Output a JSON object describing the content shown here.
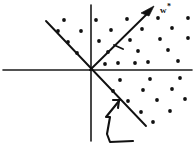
{
  "figure": {
    "background_color": "#ffffff",
    "ink_color": "#111111",
    "width": 196,
    "height": 148,
    "labels": {
      "weight_vector": "w",
      "weight_vector_superscript": "*",
      "weight_vector_full": "w*"
    }
  },
  "chart_data": {
    "type": "scatter",
    "subtitle": "",
    "xlabel": "",
    "ylabel": "",
    "grid": false,
    "legend_position": "none",
    "annotations": [
      {
        "name": "weight-vector-label",
        "text": "w*",
        "x": 161,
        "y": 10,
        "description": "Bold label marking the optimal weight vector arrow"
      },
      {
        "name": "hand-pointer-annotation",
        "text": "",
        "x": 118,
        "y": 120,
        "description": "Hand-drawn hook arrow pointing up-right at the decision boundary"
      }
    ],
    "axes": {
      "origin": {
        "x": 90,
        "y": 70
      },
      "horizontal": {
        "x1": 3,
        "y1": 70,
        "x2": 192,
        "y2": 70
      },
      "vertical": {
        "x1": 91,
        "y1": 5,
        "x2": 91,
        "y2": 141
      },
      "xlim": [
        3,
        192
      ],
      "ylim": [
        5,
        141
      ]
    },
    "lines": [
      {
        "name": "decision-boundary",
        "label": "decision boundary",
        "x1": 46,
        "y1": 21,
        "x2": 146,
        "y2": 126,
        "style": "solid"
      }
    ],
    "vectors": [
      {
        "name": "weight-vector",
        "label": "w*",
        "x1": 90,
        "y1": 70,
        "x2": 152,
        "y2": 9,
        "arrowhead": true
      },
      {
        "name": "midpoint-tick",
        "label": "",
        "x1": 115,
        "y1": 46,
        "x2": 122,
        "y2": 49,
        "arrowhead": false
      }
    ],
    "series": [
      {
        "name": "positive-examples",
        "marker": "filled-circle",
        "color": "#111111",
        "radius": 1.9,
        "points": [
          [
            64,
            20
          ],
          [
            96,
            20
          ],
          [
            127,
            19
          ],
          [
            158,
            18
          ],
          [
            188,
            18
          ],
          [
            58,
            31
          ],
          [
            81,
            31
          ],
          [
            111,
            30
          ],
          [
            142,
            29
          ],
          [
            172,
            28
          ],
          [
            68,
            42
          ],
          [
            99,
            41
          ],
          [
            130,
            40
          ],
          [
            160,
            39
          ],
          [
            188,
            38
          ],
          [
            77,
            53
          ],
          [
            108,
            52
          ],
          [
            138,
            51
          ],
          [
            168,
            50
          ],
          [
            118,
            63
          ],
          [
            148,
            62
          ],
          [
            178,
            61
          ],
          [
            105,
            64
          ],
          [
            135,
            63
          ],
          [
            120,
            80
          ],
          [
            150,
            79
          ],
          [
            180,
            78
          ],
          [
            113,
            91
          ],
          [
            143,
            90
          ],
          [
            172,
            89
          ],
          [
            128,
            101
          ],
          [
            157,
            100
          ],
          [
            185,
            99
          ],
          [
            141,
            112
          ],
          [
            170,
            111
          ],
          [
            153,
            122
          ]
        ]
      }
    ]
  }
}
